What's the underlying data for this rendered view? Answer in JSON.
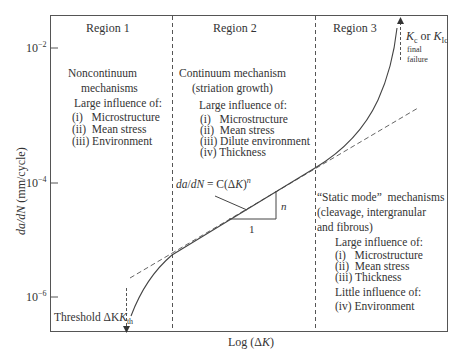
{
  "chart_data": {
    "type": "line",
    "title": "",
    "xlabel": "Log (ΔK)",
    "ylabel": "da/dN (mm/cycle)",
    "y_ticks": [
      "10^-2",
      "10^-4",
      "10^-6"
    ],
    "y_tick_labels": {
      "base": "10",
      "exp": [
        "−2",
        "−4",
        "−6"
      ]
    },
    "x_ticks": [],
    "grid": false,
    "legend": "none",
    "series": [
      {
        "name": "crack growth rate curve (sigmoidal)",
        "style": "solid",
        "description": "Rises steeply from threshold ΔK_th, linear (Paris) in Region 2, rises sharply toward K_c in Region 3"
      },
      {
        "name": "Paris law extrapolation",
        "style": "dashed",
        "equation": "da/dN = C(ΔK)^n"
      }
    ],
    "regions": [
      {
        "label": "Region 1",
        "mechanism": [
          "Noncontinuum",
          "mechanisms"
        ],
        "influence_title": "Large influence of:",
        "items": [
          "(i)   Microstructure",
          "(ii)  Mean stress",
          "(iii) Environment"
        ]
      },
      {
        "label": "Region 2",
        "mechanism": [
          "Continuum mechanism",
          "(striation growth)"
        ],
        "influence_title": "Large influence of:",
        "items": [
          "(i)   Microstructure",
          "(ii)  Mean stress",
          "(iii) Dilute environment",
          "(iv) Thickness"
        ]
      },
      {
        "label": "Region 3",
        "mechanism": [
          "“Static mode”  mechanisms",
          "(cleavage, intergranular",
          "and fibrous)"
        ],
        "influence_title": "Large influence of:",
        "items": [
          "(i)   Microstructure",
          "(ii)  Mean stress",
          "(iii) Thickness"
        ],
        "little_title": "Little influence of:",
        "little_items": [
          "(iv) Environment"
        ]
      }
    ],
    "annotations": {
      "paris_law": "da/dN = C(ΔK)",
      "paris_exp": "n",
      "slope_rise": "n",
      "slope_run": "1",
      "threshold": "Threshold ΔK",
      "threshold_sub": "th",
      "kc_K": "K",
      "kc_sub1": "c",
      "kc_or": " or ",
      "kc_sub2": "Ic",
      "final1": "final",
      "final2": "failure"
    }
  }
}
